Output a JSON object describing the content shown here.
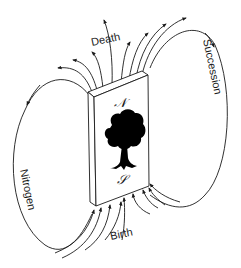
{
  "diagram": {
    "labels": {
      "top": "Death",
      "bottom": "Birth",
      "left": "Nitrogen",
      "right": "Succession"
    },
    "block": {
      "top_pole": "𝒩",
      "bottom_pole": "𝒮",
      "center_icon": "tree-icon"
    },
    "colors": {
      "stroke": "#1a1a1a",
      "background": "#ffffff",
      "tree": "#000000"
    }
  }
}
